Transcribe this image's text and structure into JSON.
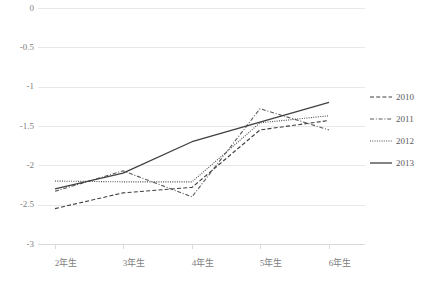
{
  "chart_data": {
    "type": "line",
    "title": "",
    "subtitle": "",
    "xlabel": "",
    "ylabel": "",
    "categories": [
      "2年生",
      "3年生",
      "4年生",
      "5年生",
      "6年生"
    ],
    "ylim": [
      -3,
      0
    ],
    "ytick_labels": [
      "0",
      "-0.5",
      "-1",
      "-1.5",
      "-2",
      "-2.5",
      "-3"
    ],
    "ytick_values": [
      0,
      -0.5,
      -1,
      -1.5,
      -2,
      -2.5,
      -3
    ],
    "grid": true,
    "legend_position": "right",
    "series": [
      {
        "name": "2010",
        "style": "dashed",
        "color": "#404040",
        "values": [
          -2.55,
          -2.35,
          -2.28,
          -1.55,
          -1.43
        ]
      },
      {
        "name": "2011",
        "style": "dash-dot",
        "color": "#595959",
        "values": [
          -2.33,
          -2.07,
          -2.4,
          -1.28,
          -1.55
        ]
      },
      {
        "name": "2012",
        "style": "dotted",
        "color": "#4d4d4d",
        "values": [
          -2.2,
          -2.21,
          -2.21,
          -1.46,
          -1.37
        ]
      },
      {
        "name": "2013",
        "style": "solid",
        "color": "#404040",
        "values": [
          -2.3,
          -2.1,
          -1.7,
          -1.45,
          -1.2
        ]
      }
    ]
  },
  "axis": {
    "gridline_color": "#e8e8e8",
    "tick_label_color": "#808080"
  }
}
